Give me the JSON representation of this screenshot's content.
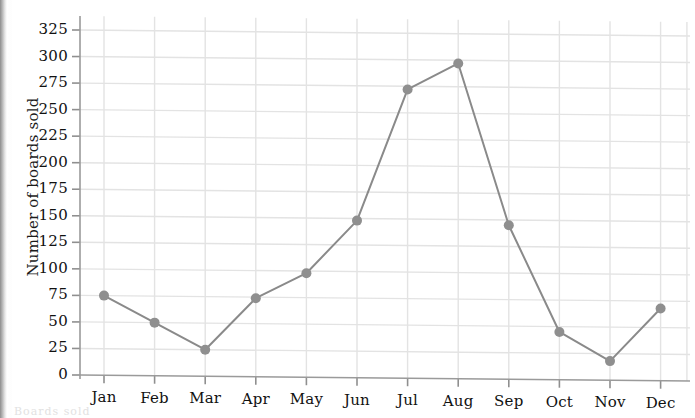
{
  "figure": {
    "background_color": "#ffffff",
    "scan_gutter_color": "#8d8d8d"
  },
  "axes": {
    "y_title": "Number of boards sold",
    "y_ticks": [
      "0",
      "25",
      "50",
      "75",
      "100",
      "125",
      "150",
      "175",
      "200",
      "225",
      "250",
      "275",
      "300",
      "325"
    ],
    "x_ticks": [
      "Jan",
      "Feb",
      "Mar",
      "Apr",
      "May",
      "Jun",
      "Jul",
      "Aug",
      "Sep",
      "Oct",
      "Nov",
      "Dec"
    ],
    "grid_color": "#e3e3e3",
    "spine_color": "#9a9a9a",
    "tick_color": "#8f8f8f"
  },
  "series_style": {
    "line_color": "#8a8a8a",
    "marker_color": "#8f8f8f",
    "line_width": 2,
    "marker_radius": 5
  },
  "page_bleed_text": "Boards sold",
  "chart_data": {
    "type": "line",
    "title": "",
    "xlabel": "",
    "ylabel": "Number of boards sold",
    "categories": [
      "Jan",
      "Feb",
      "Mar",
      "Apr",
      "May",
      "Jun",
      "Jul",
      "Aug",
      "Sep",
      "Oct",
      "Nov",
      "Dec"
    ],
    "values": [
      75,
      50,
      25,
      74,
      98,
      148,
      272,
      297,
      145,
      45,
      18,
      68
    ],
    "ylim": [
      0,
      337
    ],
    "ytick_step": 25,
    "grid": true,
    "legend": "none",
    "markers": true
  }
}
